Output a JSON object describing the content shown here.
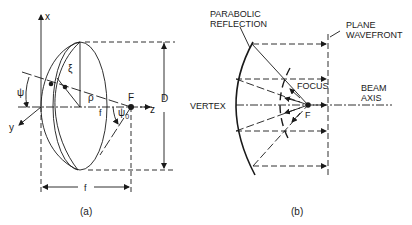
{
  "panel_a": {
    "axis_x": "x",
    "axis_y": "y",
    "axis_z": "z",
    "focus": "F",
    "diameter": "D",
    "focal_length_axis": "f",
    "focal_length_dim": "f",
    "angle_psi": "ψ",
    "angle_psi0": "ψ",
    "angle_psi0_sub": "0",
    "xi": "ξ",
    "rho": "ρ",
    "caption": "(a)"
  },
  "panel_b": {
    "label_reflection_line1": "PARABOLIC",
    "label_reflection_line2": "REFLECTION",
    "label_wavefront_line1": "PLANE",
    "label_wavefront_line2": "WAVEFRONT",
    "label_focus": "FOCUS",
    "label_beam_line1": "BEAM",
    "label_beam_line2": "AXIS",
    "label_vertex": "VERTEX",
    "focus": "F",
    "caption": "(b)"
  }
}
